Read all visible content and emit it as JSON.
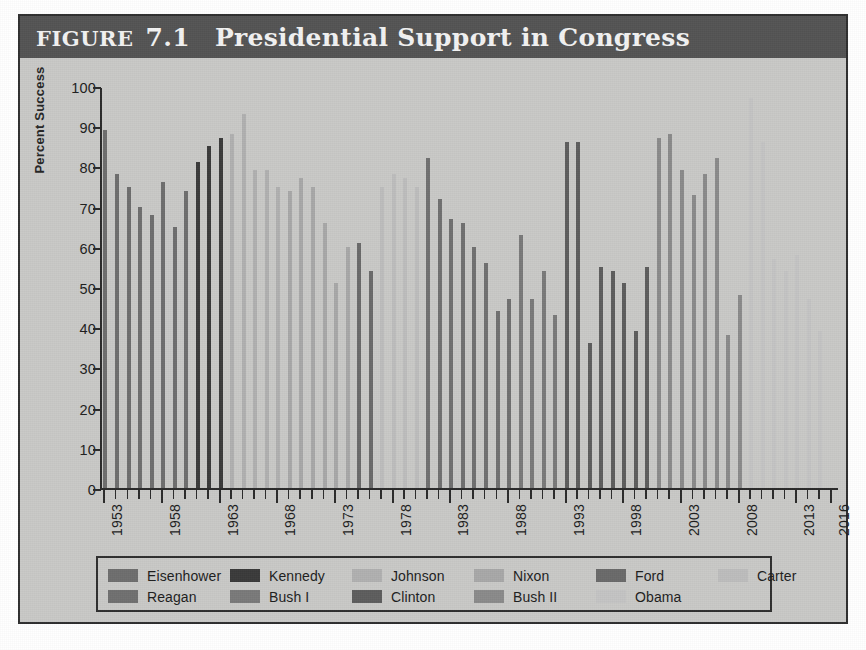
{
  "figure": {
    "label": "FIGURE",
    "number": "7.1",
    "title": "Presidential Support in Congress"
  },
  "colors": {
    "panel_background": "#c9c9c7",
    "title_bar": "#545454",
    "frame": "#2f2f2f",
    "axis": "#2a2a2a"
  },
  "legend": {
    "rows": [
      [
        {
          "label": "Eisenhower",
          "color": "#6e6e6e"
        },
        {
          "label": "Kennedy",
          "color": "#3a3a3a"
        },
        {
          "label": "Johnson",
          "color": "#b0b0b0"
        },
        {
          "label": "Nixon",
          "color": "#a8a8a8"
        },
        {
          "label": "Ford",
          "color": "#6a6a6a"
        },
        {
          "label": "Carter",
          "color": "#bdbdbd"
        }
      ],
      [
        {
          "label": "Reagan",
          "color": "#707070"
        },
        {
          "label": "Bush I",
          "color": "#7a7a7a"
        },
        {
          "label": "Clinton",
          "color": "#5d5d5d"
        },
        {
          "label": "Bush II",
          "color": "#8a8a8a"
        },
        {
          "label": "Obama",
          "color": "#c4c4c4"
        }
      ]
    ]
  },
  "chart_data": {
    "type": "bar",
    "title": "Presidential Support in Congress",
    "xlabel": "",
    "ylabel": "Percent Success",
    "ylim": [
      0,
      100
    ],
    "ytick_step": 10,
    "yticks": [
      0,
      10,
      20,
      30,
      40,
      50,
      60,
      70,
      80,
      90,
      100
    ],
    "grid": false,
    "legend_position": "below-axes",
    "xtick_labels": [
      "1953",
      "1958",
      "1963",
      "1968",
      "1973",
      "1978",
      "1983",
      "1988",
      "1993",
      "1998",
      "2003",
      "2008",
      "2013",
      "2016"
    ],
    "x_range": [
      1953,
      2016
    ],
    "series": [
      {
        "name": "Eisenhower",
        "color": "#6e6e6e",
        "points": [
          {
            "year": 1953,
            "value": 89
          },
          {
            "year": 1954,
            "value": 78
          },
          {
            "year": 1955,
            "value": 75
          },
          {
            "year": 1956,
            "value": 70
          },
          {
            "year": 1957,
            "value": 68
          },
          {
            "year": 1958,
            "value": 76
          },
          {
            "year": 1959,
            "value": 65
          },
          {
            "year": 1960,
            "value": 74
          }
        ]
      },
      {
        "name": "Kennedy",
        "color": "#3a3a3a",
        "points": [
          {
            "year": 1961,
            "value": 81
          },
          {
            "year": 1962,
            "value": 85
          },
          {
            "year": 1963,
            "value": 87
          }
        ]
      },
      {
        "name": "Johnson",
        "color": "#b0b0b0",
        "points": [
          {
            "year": 1964,
            "value": 88
          },
          {
            "year": 1965,
            "value": 93
          },
          {
            "year": 1966,
            "value": 79
          },
          {
            "year": 1967,
            "value": 79
          },
          {
            "year": 1968,
            "value": 75
          }
        ]
      },
      {
        "name": "Nixon",
        "color": "#a8a8a8",
        "points": [
          {
            "year": 1969,
            "value": 74
          },
          {
            "year": 1970,
            "value": 77
          },
          {
            "year": 1971,
            "value": 75
          },
          {
            "year": 1972,
            "value": 66
          },
          {
            "year": 1973,
            "value": 51
          },
          {
            "year": 1974,
            "value": 60
          }
        ]
      },
      {
        "name": "Ford",
        "color": "#6a6a6a",
        "points": [
          {
            "year": 1975,
            "value": 61
          },
          {
            "year": 1976,
            "value": 54
          }
        ]
      },
      {
        "name": "Carter",
        "color": "#bdbdbd",
        "points": [
          {
            "year": 1977,
            "value": 75
          },
          {
            "year": 1978,
            "value": 78
          },
          {
            "year": 1979,
            "value": 77
          },
          {
            "year": 1980,
            "value": 75
          }
        ]
      },
      {
        "name": "Reagan",
        "color": "#707070",
        "points": [
          {
            "year": 1981,
            "value": 82
          },
          {
            "year": 1982,
            "value": 72
          },
          {
            "year": 1983,
            "value": 67
          },
          {
            "year": 1984,
            "value": 66
          },
          {
            "year": 1985,
            "value": 60
          },
          {
            "year": 1986,
            "value": 56
          },
          {
            "year": 1987,
            "value": 44
          },
          {
            "year": 1988,
            "value": 47
          }
        ]
      },
      {
        "name": "Bush I",
        "color": "#7a7a7a",
        "points": [
          {
            "year": 1989,
            "value": 63
          },
          {
            "year": 1990,
            "value": 47
          },
          {
            "year": 1991,
            "value": 54
          },
          {
            "year": 1992,
            "value": 43
          }
        ]
      },
      {
        "name": "Clinton",
        "color": "#5d5d5d",
        "points": [
          {
            "year": 1993,
            "value": 86
          },
          {
            "year": 1994,
            "value": 86
          },
          {
            "year": 1995,
            "value": 36
          },
          {
            "year": 1996,
            "value": 55
          },
          {
            "year": 1997,
            "value": 54
          },
          {
            "year": 1998,
            "value": 51
          },
          {
            "year": 1999,
            "value": 39
          },
          {
            "year": 2000,
            "value": 55
          }
        ]
      },
      {
        "name": "Bush II",
        "color": "#8a8a8a",
        "points": [
          {
            "year": 2001,
            "value": 87
          },
          {
            "year": 2002,
            "value": 88
          },
          {
            "year": 2003,
            "value": 79
          },
          {
            "year": 2004,
            "value": 73
          },
          {
            "year": 2005,
            "value": 78
          },
          {
            "year": 2006,
            "value": 82
          },
          {
            "year": 2007,
            "value": 38
          },
          {
            "year": 2008,
            "value": 48
          }
        ]
      },
      {
        "name": "Obama",
        "color": "#c4c4c4",
        "points": [
          {
            "year": 2009,
            "value": 97
          },
          {
            "year": 2010,
            "value": 86
          },
          {
            "year": 2011,
            "value": 57
          },
          {
            "year": 2012,
            "value": 54
          },
          {
            "year": 2013,
            "value": 58
          },
          {
            "year": 2014,
            "value": 47
          },
          {
            "year": 2015,
            "value": 39
          }
        ]
      }
    ]
  }
}
